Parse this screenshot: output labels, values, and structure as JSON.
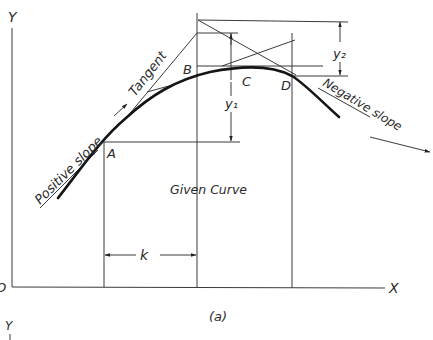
{
  "figure": {
    "caption": "(a)",
    "axes": {
      "y_label": "Y",
      "x_label": "X",
      "origin_label": "O",
      "lower_y_label": "Y"
    },
    "points": {
      "a": "A",
      "b": "B",
      "c": "C",
      "d": "D"
    },
    "labels": {
      "tangent": "Tangent",
      "positive_slope": "Positive slope",
      "negative_slope": "Negative slope",
      "given_curve": "Given Curve",
      "y1": "y₁",
      "y2": "y₂",
      "k": "k"
    },
    "colors": {
      "ink": "#2a2a2a",
      "background": "#ffffff"
    }
  }
}
